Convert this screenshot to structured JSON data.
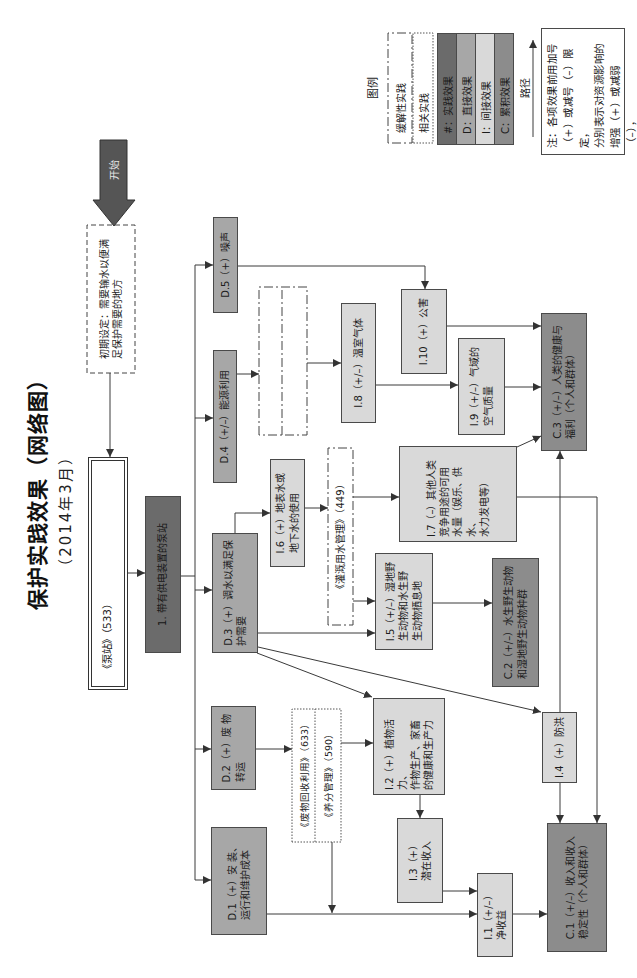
{
  "title": "保护实践效果（网络图）",
  "subtitle": "（2014年3月）",
  "start_label": "开始",
  "initial_setting": "初期设定：需要输水以便满\n足保护需要的地方",
  "conservation_practice": "《泵站》（533）",
  "practice_effect": "1. 带有供电装置的泵站",
  "direct_effects": {
    "d1": "D.1（+）安 装、\n运行和维护成本",
    "d2": "D.2（+）废 物\n转运",
    "d3": "D.3（+）调水以满足保\n护需要",
    "d4": "D.4（+/–）能源利用",
    "d5": "D.5（+）噪声"
  },
  "indirect_effects": {
    "i1": "I.1（+/–）\n净收益",
    "i2": "I.2（+）植物活力、\n作物生产、家畜\n的健康和生产力",
    "i3": "I.3（+）\n潜在收入",
    "i4": "I.4（+）防洪",
    "i5": "I.5（+/–）湿地野\n生动物和水生野\n生动物栖息地",
    "i6": "I.6（+）地表水或\n地下水的使用",
    "i7": "I.7（–）其他人类\n竞争用途的可用\n水量（娱乐、供水、\n水力发电等）",
    "i8": "I.8（+/–）温室气体",
    "i9": "I.9（+/–）气域的\n空气质量",
    "i10": "I.10（+）公害"
  },
  "cumulative_effects": {
    "c1": "C.1（+/–）收入和收入\n稳定性（个人和群体）",
    "c2": "C.2（+/–）水生野生动物\n和湿地野生动物种群",
    "c3": "C.3（+/–）人类的健康与\n福利（个人和群体）"
  },
  "related_practices": {
    "irrigation_water_management": "《灌溉用水管理》（449）",
    "waste_recycling": "《废物回收利用》（633）",
    "nutrient_management": "《养分管理》（590）"
  },
  "legend": {
    "title": "图例",
    "mitigating_practice": "缓解性实践",
    "related_practice": "相关实践",
    "items": [
      {
        "label": "#：实践效果",
        "color": "#6b6b6b"
      },
      {
        "label": "D：直接效果",
        "color": "#a7a7a7"
      },
      {
        "label": "I：间接效果",
        "color": "#d9d9d9"
      },
      {
        "label": "C：累积效果",
        "color": "#8c8c8c"
      }
    ],
    "path_label": "路径"
  },
  "note": "注：各项效果前用加号\n （+）或减号（–）限定，\n分别表示对资源影响的\n增强（+）或减弱（–），\n而不表示其有利或不利。",
  "colors": {
    "practice_effect": "#6b6b6b",
    "direct_effect": "#a7a7a7",
    "indirect_effect": "#d9d9d9",
    "cumulative_effect": "#8c8c8c",
    "start_arrow": "#555555",
    "line": "#3a3a3a"
  }
}
